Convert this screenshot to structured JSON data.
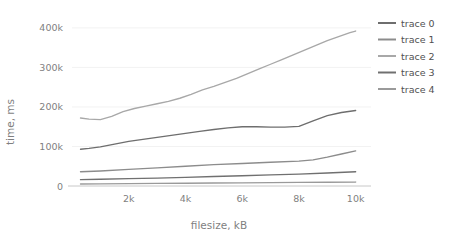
{
  "chart_data": {
    "type": "line",
    "title": "",
    "xlabel": "filesize, kB",
    "ylabel": "time, ms",
    "xlim": [
      0,
      10400
    ],
    "ylim": [
      0,
      425000
    ],
    "xticks": [
      2000,
      4000,
      6000,
      8000,
      10000
    ],
    "xticklabels": [
      "2k",
      "4k",
      "6k",
      "8k",
      "10k"
    ],
    "yticks": [
      0,
      100000,
      200000,
      300000,
      400000
    ],
    "yticklabels": [
      "0",
      "100k",
      "200k",
      "300k",
      "400k"
    ],
    "grid": true,
    "legend_position": "right",
    "series": [
      {
        "name": "trace 0",
        "color": "#6e6e6e",
        "x": [
          300,
          600,
          1000,
          1500,
          2000,
          2500,
          3000,
          3500,
          4000,
          4500,
          5000,
          5500,
          6000,
          6500,
          7000,
          7500,
          8000,
          8500,
          9000,
          9500,
          10000
        ],
        "values": [
          93000,
          95000,
          99000,
          106000,
          113000,
          118000,
          123000,
          128000,
          133000,
          138000,
          143000,
          147000,
          150000,
          150000,
          149000,
          149000,
          151000,
          165000,
          178000,
          186000,
          191000
        ]
      },
      {
        "name": "trace 1",
        "color": "#8c8c8c",
        "x": [
          300,
          1000,
          2000,
          3000,
          4000,
          5000,
          6000,
          7000,
          8000,
          8500,
          9000,
          9500,
          10000
        ],
        "values": [
          36000,
          38000,
          42000,
          46000,
          50000,
          54000,
          57000,
          60000,
          63000,
          66000,
          73000,
          81000,
          89000
        ]
      },
      {
        "name": "trace 2",
        "color": "#a8a8a8",
        "x": [
          300,
          600,
          1000,
          1400,
          1800,
          2200,
          2600,
          3000,
          3400,
          3800,
          4200,
          4600,
          5000,
          5400,
          5800,
          6200,
          6600,
          7000,
          7400,
          7800,
          8200,
          8600,
          9000,
          9400,
          9800,
          10000
        ],
        "values": [
          172000,
          169000,
          168000,
          176000,
          188000,
          196000,
          202000,
          208000,
          214000,
          222000,
          232000,
          243000,
          252000,
          262000,
          272000,
          284000,
          296000,
          308000,
          320000,
          332000,
          344000,
          356000,
          368000,
          378000,
          388000,
          392000
        ]
      },
      {
        "name": "trace 3",
        "color": "#707070",
        "x": [
          300,
          1000,
          2000,
          3000,
          4000,
          5000,
          6000,
          7000,
          8000,
          9000,
          10000
        ],
        "values": [
          16000,
          17000,
          18500,
          20000,
          22000,
          24000,
          26000,
          28000,
          30000,
          33000,
          36000
        ]
      },
      {
        "name": "trace 4",
        "color": "#9a9a9a",
        "x": [
          300,
          1000,
          2000,
          3000,
          4000,
          5000,
          6000,
          7000,
          8000,
          9000,
          10000
        ],
        "values": [
          5000,
          5500,
          6000,
          6500,
          7000,
          7500,
          8000,
          8500,
          9000,
          9500,
          10000
        ]
      }
    ]
  },
  "legend": {
    "items": [
      {
        "label": "trace 0"
      },
      {
        "label": "trace 1"
      },
      {
        "label": "trace 2"
      },
      {
        "label": "trace 3"
      },
      {
        "label": "trace 4"
      }
    ]
  },
  "axes": {
    "x_title": "filesize, kB",
    "y_title": "time, ms"
  }
}
